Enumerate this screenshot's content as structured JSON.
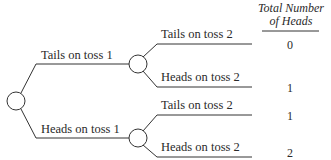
{
  "diagram": {
    "type": "probability-tree",
    "header": {
      "line1": "Total Number",
      "line2": "of Heads"
    },
    "first_level": [
      {
        "label": "Tails on toss 1"
      },
      {
        "label": "Heads on toss 1"
      }
    ],
    "second_level": [
      {
        "label": "Tails on toss 2",
        "total": "0"
      },
      {
        "label": "Heads on toss 2",
        "total": "1"
      },
      {
        "label": "Tails on toss 2",
        "total": "1"
      },
      {
        "label": "Heads on toss 2",
        "total": "2"
      }
    ],
    "colors": {
      "line": "#333333",
      "text": "#2a2a2a",
      "background": "#ffffff"
    }
  }
}
